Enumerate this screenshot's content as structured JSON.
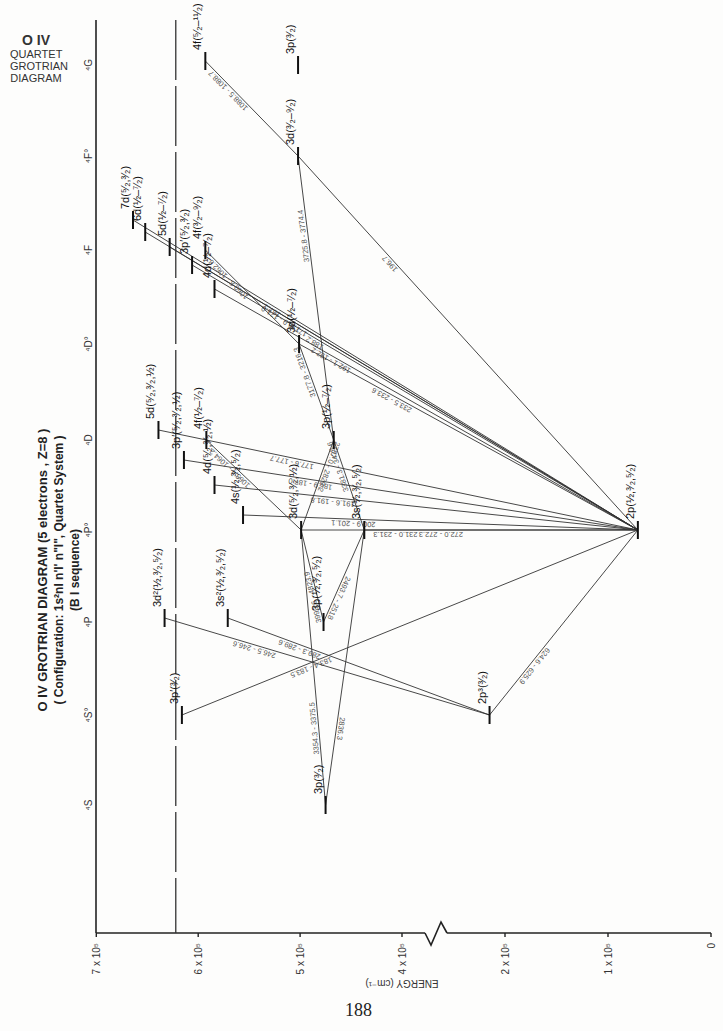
{
  "corner_title": {
    "ion": "O IV",
    "lines": [
      "QUARTET",
      "GROTRIAN",
      "DIAGRAM"
    ]
  },
  "main_title": {
    "line1": "O IV  GROTRIAN  DIAGRAM   (5 electrons , Z=8 )",
    "line2": "( Configuration:  1s²nl n'l' n\"l\",  Quartet  System )",
    "line3": "(B I  sequence)"
  },
  "page_number": "188",
  "chart_data": {
    "type": "grotrian",
    "subtitle": "Configuration: 1s2nl n'l' n\"l\", Quartet System; B I sequence",
    "xlabel": "ENERGY (cm⁻¹)",
    "axis_ticks": [
      {
        "label": "7 x 10⁵",
        "value": 700000
      },
      {
        "label": "6 x 10⁵",
        "value": 600000
      },
      {
        "label": "5 x 10⁵",
        "value": 500000
      },
      {
        "label": "4 x 10⁵",
        "value": 400000
      },
      {
        "label": "2 x 10⁵",
        "value": 200000
      },
      {
        "label": "1 x 10⁵",
        "value": 100000
      },
      {
        "label": "0",
        "value": 0
      }
    ],
    "axis_break": [
      250000,
      380000
    ],
    "ionization_limit": 622000,
    "columns": [
      "⁴S",
      "⁴S°",
      "⁴P",
      "⁴P°",
      "⁴D",
      "⁴D°",
      "⁴F",
      "⁴F°",
      "⁴G"
    ],
    "levels": [
      {
        "id": "2p_Po",
        "label": "2p(½,³⁄₂,⁵⁄₂)",
        "column": "⁴P°",
        "energy": 71000
      },
      {
        "id": "2p3_S",
        "label": "2p³(³⁄₂)",
        "column": "⁴S°",
        "energy": 230000
      },
      {
        "id": "3p_S",
        "label": "3p(³⁄₂)",
        "column": "⁴S",
        "energy": 475000
      },
      {
        "id": "3p_P",
        "label": "3p(½,³⁄₂,⁵⁄₂)",
        "column": "⁴P",
        "energy": 477000
      },
      {
        "id": "3s_Po",
        "label": "3s(½,³⁄₂,⁵⁄₂)",
        "column": "⁴P°",
        "energy": 437000
      },
      {
        "id": "3d_Po",
        "label": "3d(⁵⁄₂,³⁄₂,½)",
        "column": "⁴P°",
        "energy": 499000
      },
      {
        "id": "3p_D",
        "label": "3p(½–⁷⁄₂)",
        "column": "⁴D",
        "energy": 467000
      },
      {
        "id": "3d_Do",
        "label": "3d(½–⁷⁄₂)",
        "column": "⁴D°",
        "energy": 501000
      },
      {
        "id": "3d_Fo",
        "label": "3d(³⁄₂–⁹⁄₂)",
        "column": "⁴F°",
        "energy": 502000
      },
      {
        "id": "3p_G",
        "label": "3p(³⁄₂)",
        "column": "⁴G",
        "energy": 502000
      },
      {
        "id": "3s2_P",
        "label": "3s²(½,³⁄₂,⁵⁄₂)",
        "column": "⁴P",
        "energy": 571000
      },
      {
        "id": "3d2_P",
        "label": "3d²(½,³⁄₂,⁵⁄₂)",
        "column": "⁴P",
        "energy": 633000
      },
      {
        "id": "3p2_S",
        "label": "3p′(³⁄₂)",
        "column": "⁴S°",
        "energy": 616000
      },
      {
        "id": "4s_Po",
        "label": "4s(½,³⁄₂,⁵⁄₂)",
        "column": "⁴P°",
        "energy": 556000
      },
      {
        "id": "4d_Po",
        "label": "4d(⁵⁄₂,³⁄₂,½)",
        "column": "⁴P°",
        "energy": 584000
      },
      {
        "id": "3p2_Po",
        "label": "3p′(⁵⁄₂,³⁄₂,½)",
        "column": "⁴P°",
        "energy": 614000
      },
      {
        "id": "5d_Po",
        "label": "5d(⁵⁄₂,³⁄₂,½)",
        "column": "⁴P°",
        "energy": 639000
      },
      {
        "id": "4f_D",
        "label": "4f(½–⁷⁄₂)",
        "column": "⁴D",
        "energy": 592000
      },
      {
        "id": "4d_Do",
        "label": "4d(½–⁷⁄₂)",
        "column": "⁴D°",
        "energy": 584000
      },
      {
        "id": "3p2_Do",
        "label": "3p′(⁵⁄₂,³⁄₂)",
        "column": "⁴D°",
        "energy": 606000
      },
      {
        "id": "5d_Do",
        "label": "5d(½–⁷⁄₂)",
        "column": "⁴D°",
        "energy": 628000
      },
      {
        "id": "6d_Do",
        "label": "6d(½–⁷⁄₂)",
        "column": "⁴D°",
        "energy": 652000
      },
      {
        "id": "7d_Do",
        "label": "7d(⁵⁄₂,³⁄₂)",
        "column": "⁴D°",
        "energy": 664000
      },
      {
        "id": "4f_F",
        "label": "4f(³⁄₂–⁹⁄₂)",
        "column": "⁴F",
        "energy": 593000
      },
      {
        "id": "4f_G",
        "label": "4f(⁵⁄₂–¹¹⁄₂)",
        "column": "⁴G",
        "energy": 593000
      }
    ],
    "transitions": [
      {
        "from": "2p3_S",
        "to": "2p_Po",
        "label": "624.6 - 625.9"
      },
      {
        "from": "3p2_S",
        "to": "2p_Po",
        "label": "183.4 - 183.5"
      },
      {
        "from": "3d2_P",
        "to": "2p3_S",
        "label": "246.5 - 246.6"
      },
      {
        "from": "3s2_P",
        "to": "2p3_S",
        "label": "289.3 - 289.6"
      },
      {
        "from": "5d_Po",
        "to": "2p_Po",
        "label": "177.6 - 177.7"
      },
      {
        "from": "3p2_Po",
        "to": "2p_Po",
        "label": "186.9 - 187.0"
      },
      {
        "from": "4d_Po",
        "to": "2p_Po",
        "label": "191.6 - 191.8"
      },
      {
        "from": "4s_Po",
        "to": "2p_Po",
        "label": "200.9 - 201.1"
      },
      {
        "from": "3d_Po",
        "to": "2p_Po",
        "label": "231.0 - 231.3"
      },
      {
        "from": "3s_Po",
        "to": "2p_Po",
        "label": "272.0 - 272.3"
      },
      {
        "from": "3p_P",
        "to": "3d_Po",
        "label": "3990.6 - 4823.9"
      },
      {
        "from": "3p_P",
        "to": "3s_Po",
        "label": "2493.7 - 2518"
      },
      {
        "from": "3p_S",
        "to": "3s_Po",
        "label": "2836.3"
      },
      {
        "from": "3p_S",
        "to": "3d_Po",
        "label": "3354.3 - 3375.5"
      },
      {
        "from": "4f_D",
        "to": "3d_Po",
        "label": "1063.4 - 1064.2"
      },
      {
        "from": "3p_D",
        "to": "3d_Po",
        "label": "2787.0 - 2829.2"
      },
      {
        "from": "3p_D",
        "to": "3s_Po",
        "label": "3381.3 - 3425.6"
      },
      {
        "from": "7d_Do",
        "to": "2p_Po",
        "label": "167.1"
      },
      {
        "from": "6d_Do",
        "to": "2p_Po",
        "label": "170.9 - 171.0"
      },
      {
        "from": "5d_Do",
        "to": "2p_Po",
        "label": "177.8"
      },
      {
        "from": "3p2_Do",
        "to": "2p_Po",
        "label": "188.2"
      },
      {
        "from": "4d_Do",
        "to": "2p_Po",
        "label": "192.1 - 192.2"
      },
      {
        "from": "3d_Do",
        "to": "2p_Po",
        "label": "233.5 - 233.6"
      },
      {
        "from": "3d_Do",
        "to": "3p_D",
        "label": "3177.8 - 3216.3"
      },
      {
        "from": "4f_F",
        "to": "3d_Do",
        "label": "1060.8 - 1062.8"
      },
      {
        "from": "3d_Fo",
        "to": "3p_D",
        "label": "3725.8 - 3774.4"
      },
      {
        "from": "3d_Fo",
        "to": "2p_Po",
        "label": "196.7"
      },
      {
        "from": "4f_G",
        "to": "3d_Fo",
        "label": "1088.5 - 1088.7"
      }
    ]
  }
}
